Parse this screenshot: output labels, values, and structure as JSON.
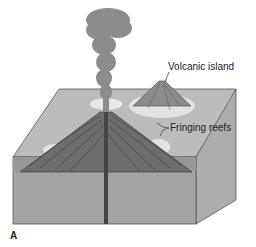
{
  "figure": {
    "labels": {
      "volcanic_island": "Volcanic island",
      "fringing_reefs": "Fringing reefs",
      "panel": "A"
    },
    "colors": {
      "block_top": "#b9b9b9",
      "block_front": "#a2a2a2",
      "block_side": "#b0b0b0",
      "volcano": "#6e6e6e",
      "reef": "#e2e2e2",
      "smoke": "#8a8a8a"
    }
  }
}
